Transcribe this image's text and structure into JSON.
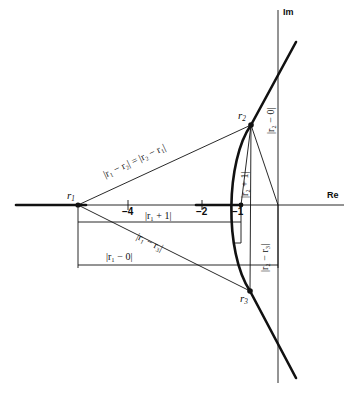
{
  "figure": {
    "type": "complex-plane-diagram",
    "axes": {
      "real_label": "Re",
      "imag_label": "Im"
    },
    "ticks": [
      {
        "id": "tick-minus-4",
        "label": "−4"
      },
      {
        "id": "tick-minus-2",
        "label": "−2"
      },
      {
        "id": "tick-minus-1",
        "label": "−1"
      }
    ],
    "points": [
      {
        "id": "r1",
        "label": "r",
        "sub": "1"
      },
      {
        "id": "r2",
        "label": "r",
        "sub": "2"
      },
      {
        "id": "r3",
        "label": "r",
        "sub": "3"
      }
    ],
    "measures": [
      {
        "id": "r1-r2-equals-r2-r1",
        "text": "|r₁ − r₂| = |r₂ − r₁|"
      },
      {
        "id": "r2-minus-0",
        "text": "|r₂ − 0|"
      },
      {
        "id": "r2-plus-1",
        "text": "|r₂ + 1|"
      },
      {
        "id": "r2-minus-r3",
        "text": "|r₂ − r₃|"
      },
      {
        "id": "r1-plus-1",
        "text": "|r₁ + 1|"
      },
      {
        "id": "r1-minus-r3",
        "text": "|r₁ − r₃|"
      },
      {
        "id": "r1-minus-0",
        "text": "|r₁ − 0|"
      }
    ],
    "colors": {
      "ink": "#111111",
      "background": "#ffffff"
    }
  }
}
